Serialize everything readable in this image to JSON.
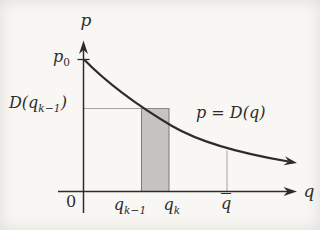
{
  "figure": {
    "type": "math-diagram",
    "colors": {
      "background": "#f8f7f4",
      "ink": "#2e2c29",
      "shade_fill": "#c5c4c1",
      "shade_stroke": "#71706d",
      "thin_line": "#908e8a"
    },
    "labels": {
      "y_axis": "p",
      "x_axis": "q",
      "origin": "0",
      "p0": {
        "base": "p",
        "sub": "0"
      },
      "d_of_qk1": {
        "pre": "D(q",
        "sub": "k−1",
        "post": ")"
      },
      "curve_equation": "p = D(q)",
      "qk1": {
        "base": "q",
        "sub": "k−1"
      },
      "qk": {
        "base": "q",
        "sub": "k"
      },
      "qbar": "q"
    }
  }
}
